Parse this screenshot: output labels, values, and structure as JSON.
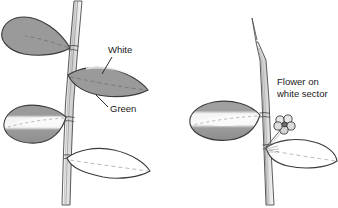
{
  "figure": {
    "background_color": "#ffffff",
    "line_color": "#3a3a3a",
    "green_tissue_color": "#9a9a9a",
    "white_tissue_color": "#ffffff",
    "stem_shade_color": "#c9c9c9"
  },
  "labels": {
    "white": "White",
    "green": "Green",
    "flower_on_white_sector_line1": "Flower on",
    "flower_on_white_sector_line2": "white sector"
  },
  "left_plant": {
    "name": "left-plant",
    "leaves": [
      {
        "name": "upper-left-leaf",
        "tissue": "green"
      },
      {
        "name": "middle-right-leaf",
        "tissue": "green-with-white-tip"
      },
      {
        "name": "lower-left-leaf",
        "tissue": "variegated"
      },
      {
        "name": "lower-right-leaf",
        "tissue": "white"
      }
    ]
  },
  "right_plant": {
    "name": "right-plant",
    "leaves": [
      {
        "name": "upper-left-leaf",
        "tissue": "variegated"
      },
      {
        "name": "lower-right-leaf",
        "tissue": "white"
      }
    ],
    "flower": {
      "name": "flower",
      "tissue": "white",
      "petal_count": 5
    }
  }
}
